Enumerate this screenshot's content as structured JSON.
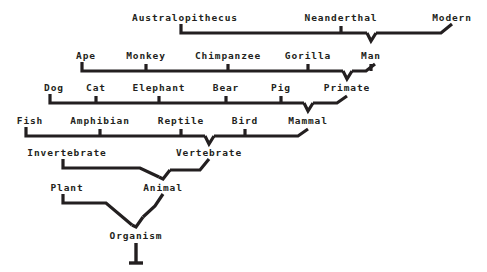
{
  "diagram": {
    "type": "hierarchy-tree",
    "background_color": "#ffffff",
    "ink_color": "#231f20",
    "root": "Organism",
    "levels": [
      {
        "index": 0,
        "y": 17,
        "labels": [
          "Australopithecus",
          "Neanderthal",
          "Modern"
        ],
        "parent": "Man"
      },
      {
        "index": 1,
        "y": 55,
        "labels": [
          "Ape",
          "Monkey",
          "Chimpanzee",
          "Gorilla",
          "Man"
        ],
        "parent": "Primate"
      },
      {
        "index": 2,
        "y": 87,
        "labels": [
          "Dog",
          "Cat",
          "Elephant",
          "Bear",
          "Pig",
          "Primate"
        ],
        "parent": "Mammal"
      },
      {
        "index": 3,
        "y": 120,
        "labels": [
          "Fish",
          "Amphibian",
          "Reptile",
          "Bird",
          "Mammal"
        ],
        "parent": "Vertebrate"
      },
      {
        "index": 4,
        "y": 152,
        "labels": [
          "Invertebrate",
          "Vertebrate"
        ],
        "parent": "Animal"
      },
      {
        "index": 5,
        "y": 187,
        "labels": [
          "Plant",
          "Animal"
        ],
        "parent": "Organism"
      },
      {
        "index": 6,
        "y": 235,
        "labels": [
          "Organism"
        ],
        "parent": null
      }
    ],
    "nodes": [
      {
        "id": "australopithecus",
        "label": "Australopithecus",
        "x": 185,
        "y": 17
      },
      {
        "id": "neanderthal",
        "label": "Neanderthal",
        "x": 341,
        "y": 17
      },
      {
        "id": "modern",
        "label": "Modern",
        "x": 452,
        "y": 17
      },
      {
        "id": "ape",
        "label": "Ape",
        "x": 86,
        "y": 55
      },
      {
        "id": "monkey",
        "label": "Monkey",
        "x": 146,
        "y": 55
      },
      {
        "id": "chimpanzee",
        "label": "Chimpanzee",
        "x": 228,
        "y": 55
      },
      {
        "id": "gorilla",
        "label": "Gorilla",
        "x": 308,
        "y": 55
      },
      {
        "id": "man",
        "label": "Man",
        "x": 371,
        "y": 55
      },
      {
        "id": "dog",
        "label": "Dog",
        "x": 54,
        "y": 87
      },
      {
        "id": "cat",
        "label": "Cat",
        "x": 96,
        "y": 87
      },
      {
        "id": "elephant",
        "label": "Elephant",
        "x": 159,
        "y": 87
      },
      {
        "id": "bear",
        "label": "Bear",
        "x": 226,
        "y": 87
      },
      {
        "id": "pig",
        "label": "Pig",
        "x": 281,
        "y": 87
      },
      {
        "id": "primate",
        "label": "Primate",
        "x": 347,
        "y": 87
      },
      {
        "id": "fish",
        "label": "Fish",
        "x": 30,
        "y": 120
      },
      {
        "id": "amphibian",
        "label": "Amphibian",
        "x": 100,
        "y": 120
      },
      {
        "id": "reptile",
        "label": "Reptile",
        "x": 181,
        "y": 120
      },
      {
        "id": "bird",
        "label": "Bird",
        "x": 245,
        "y": 120
      },
      {
        "id": "mammal",
        "label": "Mammal",
        "x": 308,
        "y": 120
      },
      {
        "id": "invertebrate",
        "label": "Invertebrate",
        "x": 67,
        "y": 152
      },
      {
        "id": "vertebrate",
        "label": "Vertebrate",
        "x": 209,
        "y": 152
      },
      {
        "id": "plant",
        "label": "Plant",
        "x": 67,
        "y": 187
      },
      {
        "id": "animal",
        "label": "Animal",
        "x": 163,
        "y": 187
      },
      {
        "id": "organism",
        "label": "Organism",
        "x": 136,
        "y": 235
      }
    ],
    "edges": [
      {
        "parent": "Man",
        "children": [
          "Australopithecus",
          "Neanderthal",
          "Modern"
        ]
      },
      {
        "parent": "Primate",
        "children": [
          "Ape",
          "Monkey",
          "Chimpanzee",
          "Gorilla",
          "Man"
        ]
      },
      {
        "parent": "Mammal",
        "children": [
          "Dog",
          "Cat",
          "Elephant",
          "Bear",
          "Pig",
          "Primate"
        ]
      },
      {
        "parent": "Vertebrate",
        "children": [
          "Fish",
          "Amphibian",
          "Reptile",
          "Bird",
          "Mammal"
        ]
      },
      {
        "parent": "Animal",
        "children": [
          "Invertebrate",
          "Vertebrate"
        ]
      },
      {
        "parent": "Organism",
        "children": [
          "Plant",
          "Animal"
        ]
      }
    ]
  }
}
